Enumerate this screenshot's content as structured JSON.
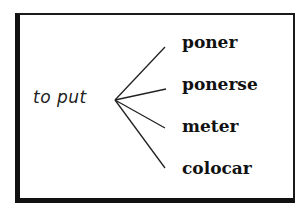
{
  "diagram": {
    "type": "word-mapping",
    "source": {
      "label": "to put"
    },
    "targets": [
      {
        "label": "poner"
      },
      {
        "label": "ponerse"
      },
      {
        "label": "meter"
      },
      {
        "label": "colocar"
      }
    ],
    "colors": {
      "line": "#222222",
      "border": "#111111",
      "background": "#ffffff"
    }
  }
}
